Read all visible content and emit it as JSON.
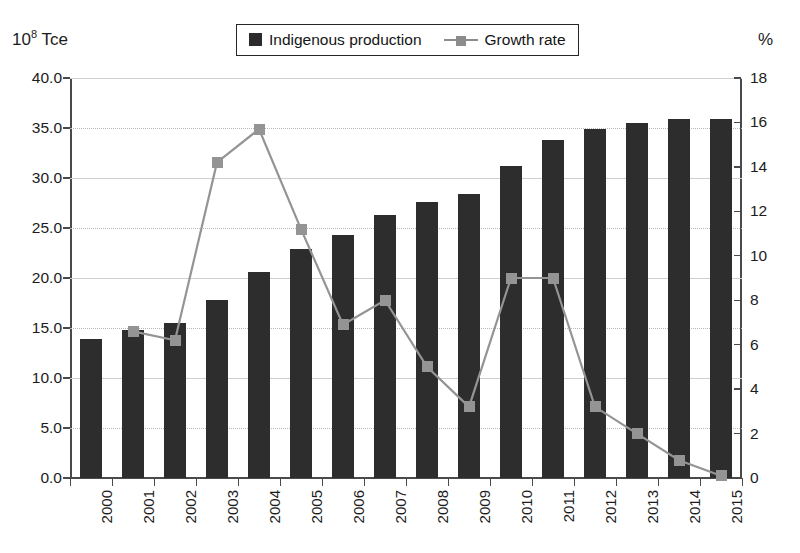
{
  "axis_unit_left_prefix": "10",
  "axis_unit_left_exp": "8",
  "axis_unit_left_suffix": " Tce",
  "axis_unit_right": "%",
  "legend": {
    "bar_label": "Indigenous production",
    "line_label": "Growth rate",
    "bar_icon": "filled-square-icon",
    "line_icon": "line-with-square-marker-icon"
  },
  "colors": {
    "bar": "#2d2d2d",
    "line": "#949494",
    "marker": "#949494",
    "axis": "#4a4a4a",
    "grid": "#b9b9b9",
    "background": "#ffffff"
  },
  "chart_data": {
    "type": "bar",
    "title": "",
    "subtitle": "",
    "xlabel": "",
    "ylabel": "10^8 Tce",
    "y2label": "%",
    "categories": [
      "2000",
      "2001",
      "2002",
      "2003",
      "2004",
      "2005",
      "2006",
      "2007",
      "2008",
      "2009",
      "2010",
      "2011",
      "2012",
      "2013",
      "2014",
      "2015"
    ],
    "ylim": [
      0,
      40
    ],
    "y2lim": [
      0,
      18
    ],
    "yticks": [
      "0.0",
      "5.0",
      "10.0",
      "15.0",
      "20.0",
      "25.0",
      "30.0",
      "35.0",
      "40.0"
    ],
    "y2ticks": [
      "0",
      "2",
      "4",
      "6",
      "8",
      "10",
      "12",
      "14",
      "16",
      "18"
    ],
    "grid": true,
    "legend_position": "top-center",
    "series": [
      {
        "name": "Indigenous production",
        "type": "bar",
        "axis": "left",
        "unit": "10^8 Tce",
        "values": [
          13.9,
          14.8,
          15.5,
          17.8,
          20.6,
          22.9,
          24.3,
          26.3,
          27.6,
          28.4,
          31.2,
          33.8,
          34.9,
          35.5,
          35.9,
          35.9
        ]
      },
      {
        "name": "Growth rate",
        "type": "line",
        "axis": "right",
        "unit": "%",
        "values": [
          null,
          6.6,
          6.2,
          14.2,
          15.7,
          11.2,
          6.9,
          8.0,
          5.0,
          3.2,
          9.0,
          9.0,
          3.2,
          2.0,
          0.8,
          0.1
        ]
      }
    ]
  }
}
